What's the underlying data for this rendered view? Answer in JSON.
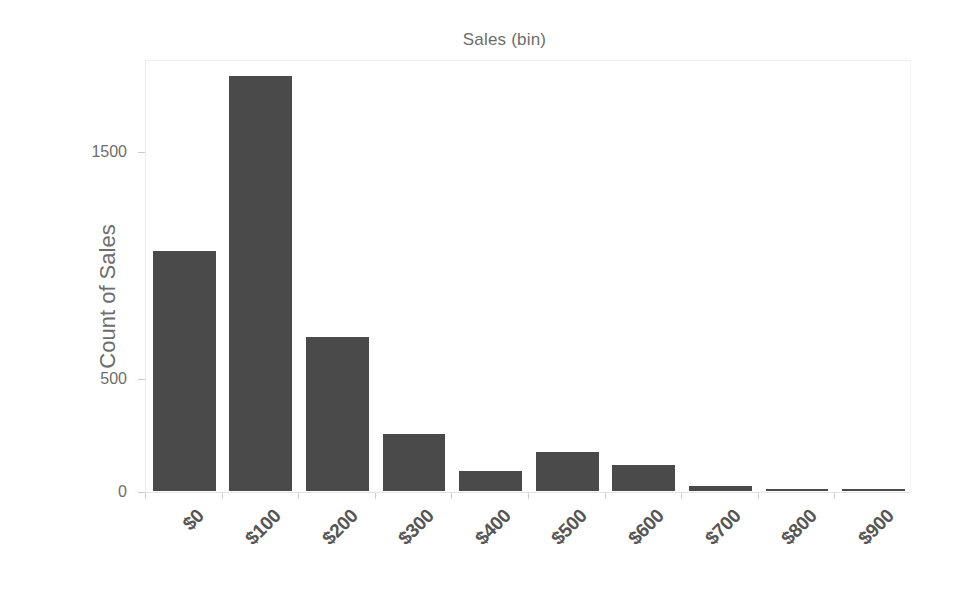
{
  "chart_data": {
    "type": "bar",
    "title": "Sales (bin)",
    "xlabel": "",
    "ylabel": "Count of Sales",
    "categories": [
      "$0",
      "$100",
      "$200",
      "$300",
      "$400",
      "$500",
      "$600",
      "$700",
      "$800",
      "$900"
    ],
    "values": [
      1057,
      1828,
      678,
      251,
      88,
      172,
      115,
      22,
      5,
      3
    ],
    "ylim": [
      -60,
      1908
    ],
    "ytick_values": [
      0,
      500,
      1500
    ],
    "ytick_labels": [
      "0",
      "500",
      "1500"
    ],
    "grid": false,
    "legend": false,
    "bar_color": "#4a4a4a",
    "text_color": "#6d6d6d",
    "tick_label_color": "#555555",
    "plot_border_color": "#f0f0f0",
    "background_color": "#ffffff",
    "xtick_rotation": "-45"
  },
  "figure": {
    "title_text": "Sales (bin)",
    "y_axis_title": "Count of Sales"
  }
}
